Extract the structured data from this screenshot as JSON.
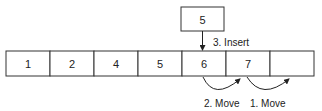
{
  "insert_box": {
    "value": "5"
  },
  "array": {
    "cells": [
      "1",
      "2",
      "4",
      "5",
      "6",
      "7",
      ""
    ]
  },
  "labels": {
    "insert": "3. Insert",
    "move2": "2. Move",
    "move1": "1. Move"
  }
}
